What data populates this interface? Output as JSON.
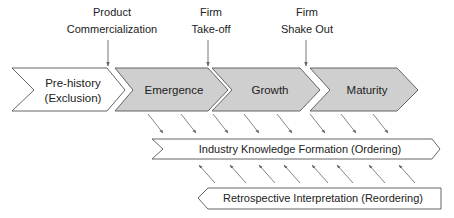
{
  "milestones": [
    {
      "line1": "Product",
      "line2": "Commercialization"
    },
    {
      "line1": "Firm",
      "line2": "Take-off"
    },
    {
      "line1": "Firm",
      "line2": "Shake Out"
    }
  ],
  "stages": [
    {
      "line1": "Pre-history",
      "line2": "(Exclusion)",
      "fill": "#ffffff"
    },
    {
      "label": "Emergence",
      "fill": "#cfcfcf"
    },
    {
      "label": "Growth",
      "fill": "#cfcfcf"
    },
    {
      "label": "Maturity",
      "fill": "#cfcfcf"
    }
  ],
  "processes": {
    "ordering": {
      "label": "Industry Knowledge Formation (Ordering)",
      "direction": "right"
    },
    "reordering": {
      "label": "Retrospective Interpretation (Reordering)",
      "direction": "left"
    }
  },
  "colors": {
    "stroke": "#555555",
    "stage_fill": "#cfcfcf",
    "arrow": "#666666",
    "text": "#222222"
  }
}
